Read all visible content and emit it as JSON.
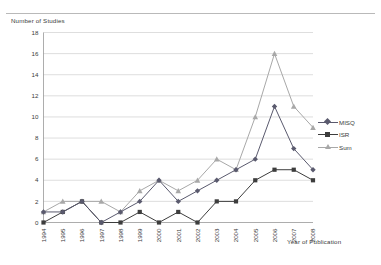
{
  "chart_data": {
    "type": "line",
    "title": "",
    "xlabel": "Year of Publication",
    "ylabel": "Number of Studies",
    "categories": [
      "1994",
      "1995",
      "1996",
      "1997",
      "1998",
      "1999",
      "2000",
      "2001",
      "2002",
      "2003",
      "2004",
      "2005",
      "2006",
      "2007",
      "2008"
    ],
    "ylim": [
      0,
      18
    ],
    "yticks": [
      0,
      2,
      4,
      6,
      8,
      10,
      12,
      14,
      16,
      18
    ],
    "grid": true,
    "legend_position": "right",
    "series": [
      {
        "name": "MISQ",
        "marker": "diamond",
        "color": "#5a5a6e",
        "values": [
          1,
          1,
          2,
          0,
          1,
          2,
          4,
          2,
          3,
          4,
          5,
          6,
          11,
          7,
          5
        ]
      },
      {
        "name": "ISR",
        "marker": "square",
        "color": "#3d3d3d",
        "values": [
          0,
          1,
          2,
          0,
          0,
          1,
          0,
          1,
          0,
          2,
          2,
          4,
          5,
          5,
          4
        ]
      },
      {
        "name": "Sum",
        "marker": "triangle",
        "color": "#a8a8a8",
        "values": [
          1,
          2,
          2,
          2,
          1,
          3,
          4,
          3,
          4,
          6,
          5,
          10,
          16,
          11,
          9
        ]
      }
    ]
  },
  "legend": {
    "items": [
      {
        "label": "MISQ"
      },
      {
        "label": "ISR"
      },
      {
        "label": "Sum"
      }
    ]
  },
  "axes": {
    "y_title": "Number of Studies",
    "x_title": "Year of Publication"
  }
}
